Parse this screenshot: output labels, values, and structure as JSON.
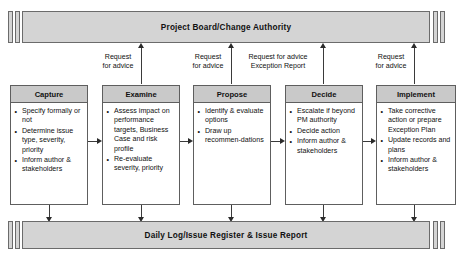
{
  "diagram": {
    "top_lane": {
      "label": "Project Board/Change Authority"
    },
    "bottom_lane": {
      "label": "Daily Log/Issue Register & Issue Report"
    },
    "processes": [
      {
        "title": "Capture",
        "bullets": [
          "Specify formally or not",
          "Determine issue type, severity, priority",
          "Inform author & stakeholders"
        ]
      },
      {
        "title": "Examine",
        "bullets": [
          "Assess impact on performance targets, Business Case and risk profile",
          "Re-evaluate severity, priority"
        ]
      },
      {
        "title": "Propose",
        "bullets": [
          "Identify & evaluate options",
          "Draw up recommen-dations"
        ]
      },
      {
        "title": "Decide",
        "bullets": [
          "Escalate if beyond PM authority",
          "Decide action",
          "Inform author & stakeholders"
        ]
      },
      {
        "title": "Implement",
        "bullets": [
          "Take corrective action or prepare Exception Plan",
          "Update records and plans",
          "Inform author & stakeholders"
        ]
      }
    ],
    "escalation_labels": [
      "Request\nfor advice",
      "Request\nfor advice",
      "Request for advice\nException Report",
      "Request\nfor advice"
    ],
    "colors": {
      "lane_fill": "#d4d4d4",
      "header_fill": "#c9c9c9",
      "box_fill": "#ffffff",
      "line": "#3a3a3a",
      "text": "#111111"
    }
  }
}
